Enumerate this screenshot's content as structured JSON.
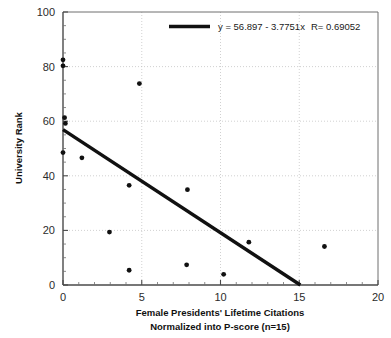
{
  "chart_data": {
    "type": "scatter",
    "title": "",
    "xlabel": "Female Presidents' Lifetime Citations",
    "xlabel_line2": "Normalized into P-score (n=15)",
    "ylabel": "University Rank",
    "xlim": [
      0,
      20
    ],
    "ylim": [
      0,
      100
    ],
    "xticks": [
      "0",
      "5",
      "10",
      "15",
      "20"
    ],
    "xtick_values": [
      0,
      5,
      10,
      15,
      20
    ],
    "yticks": [
      "0",
      "20",
      "40",
      "60",
      "80",
      "100"
    ],
    "ytick_values": [
      0,
      20,
      40,
      60,
      80,
      100
    ],
    "grid": true,
    "grid_style": "dotted",
    "legend_position": "top-right",
    "series": [
      {
        "name": "Female Presidents",
        "marker": "circle",
        "color": "#111111",
        "points": [
          {
            "x": 0.0,
            "y": 82.5
          },
          {
            "x": 0.0,
            "y": 80.3
          },
          {
            "x": 4.85,
            "y": 73.8
          },
          {
            "x": 0.1,
            "y": 61.3
          },
          {
            "x": 0.15,
            "y": 59.2
          },
          {
            "x": 0.0,
            "y": 48.5
          },
          {
            "x": 1.2,
            "y": 46.6
          },
          {
            "x": 4.2,
            "y": 36.5
          },
          {
            "x": 7.9,
            "y": 34.9
          },
          {
            "x": 2.95,
            "y": 19.4
          },
          {
            "x": 11.8,
            "y": 15.7
          },
          {
            "x": 16.6,
            "y": 14.1
          },
          {
            "x": 7.85,
            "y": 7.4
          },
          {
            "x": 4.2,
            "y": 5.4
          },
          {
            "x": 10.2,
            "y": 3.9
          }
        ]
      }
    ],
    "fit_line": {
      "equation_text": "y = 56.897 - 3.7751x",
      "r_text": "R= 0.69052",
      "intercept": 56.897,
      "slope": -3.7751,
      "r": 0.69052,
      "color": "#111111",
      "x_start": 0,
      "x_end": 15.07
    }
  },
  "legend": {
    "equation": "y = 56.897 - 3.7751x",
    "correlation": "R= 0.69052"
  },
  "axes": {
    "y_title": "University Rank",
    "x_title_line1": "Female Presidents' Lifetime Citations",
    "x_title_line2": "Normalized into P-score (n=15)"
  }
}
